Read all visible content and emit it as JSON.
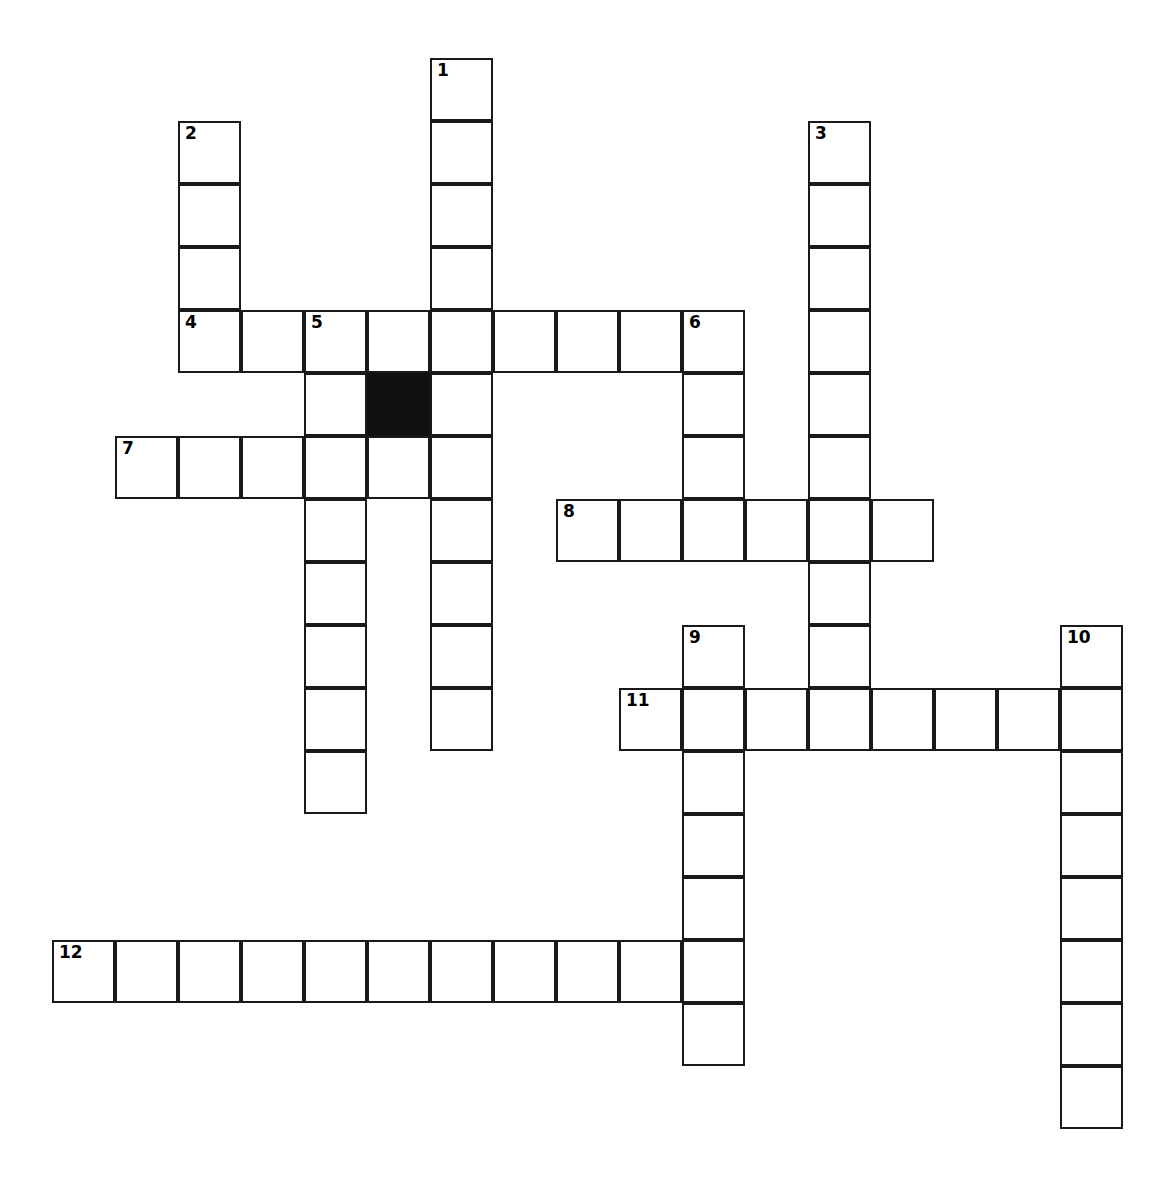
{
  "page": {
    "kind": "crossword-grid",
    "title": "",
    "width": 1149,
    "height": 1191,
    "background_color": "#ffffff",
    "grid_line_color": "#1a1a1a",
    "block_color": "#111111",
    "cell_size": 63,
    "origin_x": 52,
    "origin_y": 58
  },
  "grid": {
    "columns": 18,
    "rows": 18,
    "blocked_cells": [
      {
        "col": 5,
        "row": 5,
        "label": "black-square"
      }
    ],
    "entries": [
      {
        "number": "1",
        "direction": "down",
        "start_col": 6,
        "start_row": 0,
        "length": 11
      },
      {
        "number": "2",
        "direction": "down",
        "start_col": 2,
        "start_row": 1,
        "length": 4
      },
      {
        "number": "3",
        "direction": "down",
        "start_col": 12,
        "start_row": 1,
        "length": 10
      },
      {
        "number": "4",
        "direction": "across",
        "start_col": 2,
        "start_row": 4,
        "length": 9
      },
      {
        "number": "5",
        "direction": "down",
        "start_col": 4,
        "start_row": 4,
        "length": 8
      },
      {
        "number": "6",
        "direction": "down",
        "start_col": 10,
        "start_row": 4,
        "length": 4
      },
      {
        "number": "7",
        "direction": "across",
        "start_col": 1,
        "start_row": 6,
        "length": 6
      },
      {
        "number": "8",
        "direction": "across",
        "start_col": 8,
        "start_row": 7,
        "length": 6
      },
      {
        "number": "9",
        "direction": "down",
        "start_col": 10,
        "start_row": 9,
        "length": 7
      },
      {
        "number": "10",
        "direction": "down",
        "start_col": 16,
        "start_row": 9,
        "length": 8
      },
      {
        "number": "11",
        "direction": "across",
        "start_col": 9,
        "start_row": 10,
        "length": 8
      },
      {
        "number": "12",
        "direction": "across",
        "start_col": 0,
        "start_row": 14,
        "length": 11
      }
    ],
    "numbered_cells": [
      {
        "number": "1",
        "col": 6,
        "row": 0
      },
      {
        "number": "2",
        "col": 2,
        "row": 1
      },
      {
        "number": "3",
        "col": 12,
        "row": 1
      },
      {
        "number": "4",
        "col": 2,
        "row": 4
      },
      {
        "number": "5",
        "col": 4,
        "row": 4
      },
      {
        "number": "6",
        "col": 10,
        "row": 4
      },
      {
        "number": "7",
        "col": 1,
        "row": 6
      },
      {
        "number": "8",
        "col": 8,
        "row": 7
      },
      {
        "number": "9",
        "col": 10,
        "row": 9
      },
      {
        "number": "10",
        "col": 16,
        "row": 9
      },
      {
        "number": "11",
        "col": 9,
        "row": 10
      },
      {
        "number": "12",
        "col": 0,
        "row": 14
      }
    ],
    "filled_letters": []
  }
}
